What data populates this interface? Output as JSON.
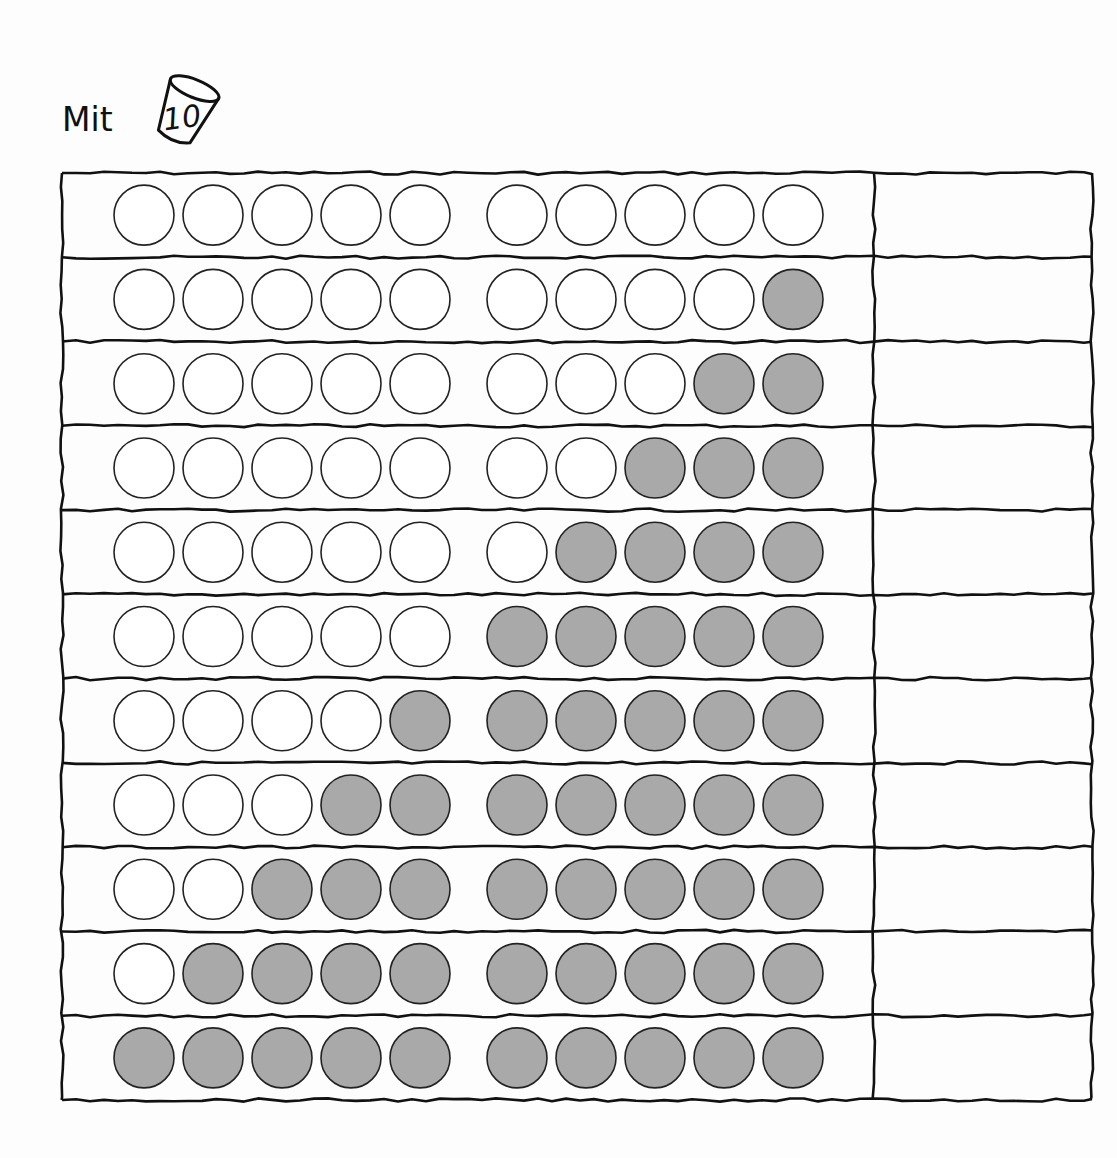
{
  "header": {
    "label": "Mit",
    "cup_number": "10",
    "cup_icon": "cup-icon"
  },
  "worksheet": {
    "rows_count": 11,
    "circles_per_row": 10,
    "group_size": 5,
    "colors": {
      "filled": "#a9a9a9",
      "empty": "#ffffff",
      "stroke": "#222222",
      "line": "#111111"
    },
    "rows": [
      {
        "filled": 0,
        "answer": ""
      },
      {
        "filled": 1,
        "answer": ""
      },
      {
        "filled": 2,
        "answer": ""
      },
      {
        "filled": 3,
        "answer": ""
      },
      {
        "filled": 4,
        "answer": ""
      },
      {
        "filled": 5,
        "answer": ""
      },
      {
        "filled": 6,
        "answer": ""
      },
      {
        "filled": 7,
        "answer": ""
      },
      {
        "filled": 8,
        "answer": ""
      },
      {
        "filled": 9,
        "answer": ""
      },
      {
        "filled": 10,
        "answer": ""
      }
    ]
  }
}
